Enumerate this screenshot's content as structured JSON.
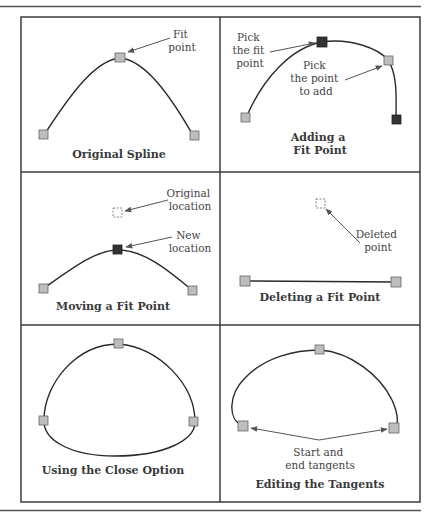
{
  "figure": {
    "panels": [
      {
        "id": "original-spline",
        "caption": [
          "Original Spline"
        ],
        "callouts": [
          {
            "lines": [
              "Fit",
              "point"
            ]
          }
        ]
      },
      {
        "id": "adding-fit-point",
        "caption": [
          "Adding a",
          "Fit Point"
        ],
        "callouts": [
          {
            "lines": [
              "Pick",
              "the fit",
              "point"
            ]
          },
          {
            "lines": [
              "Pick",
              "the point",
              "to add"
            ]
          }
        ]
      },
      {
        "id": "moving-fit-point",
        "caption": [
          "Moving a Fit Point"
        ],
        "callouts": [
          {
            "lines": [
              "Original",
              "location"
            ]
          },
          {
            "lines": [
              "New",
              "location"
            ]
          }
        ]
      },
      {
        "id": "deleting-fit-point",
        "caption": [
          "Deleting a Fit Point"
        ],
        "callouts": [
          {
            "lines": [
              "Deleted",
              "point"
            ]
          }
        ]
      },
      {
        "id": "close-option",
        "caption": [
          "Using the Close Option"
        ],
        "callouts": []
      },
      {
        "id": "editing-tangents",
        "caption": [
          "Editing the Tangents"
        ],
        "callouts": [
          {
            "lines": [
              "Start and",
              "end tangents"
            ]
          }
        ]
      }
    ],
    "colors": {
      "frame": "#3c3c3c",
      "curve": "#2a2a2a",
      "fit_point_fill": "#bdbdbd",
      "selected_point_fill": "#333333",
      "text": "#444444"
    }
  }
}
